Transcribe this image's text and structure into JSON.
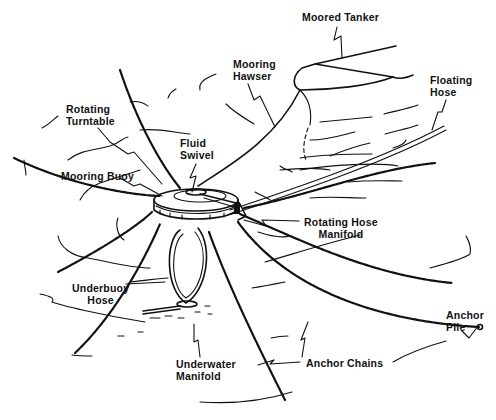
{
  "diagram": {
    "colors": {
      "ink": "#111111",
      "background": "#ffffff"
    },
    "labels": {
      "moored_tanker": {
        "lines": [
          "Moored Tanker"
        ]
      },
      "mooring_hawser": {
        "lines": [
          "Mooring",
          "Hawser"
        ]
      },
      "floating_hose": {
        "lines": [
          "Floating",
          "Hose"
        ]
      },
      "rotating_turntable": {
        "lines": [
          "Rotating",
          "Turntable"
        ]
      },
      "fluid_swivel": {
        "lines": [
          "Fluid",
          "Swivel"
        ]
      },
      "mooring_buoy": {
        "lines": [
          "Mooring Buoy"
        ]
      },
      "rotating_hose_manifold": {
        "lines": [
          "Rotating Hose",
          "Manifold"
        ]
      },
      "underbuoy_hose": {
        "lines": [
          "Underbuoy",
          "Hose"
        ]
      },
      "anchor_pile": {
        "lines": [
          "Anchor",
          "Pile"
        ]
      },
      "underwater_manifold": {
        "lines": [
          "Underwater",
          "Manifold"
        ]
      },
      "anchor_chains": {
        "lines": [
          "Anchor Chains"
        ]
      }
    }
  }
}
